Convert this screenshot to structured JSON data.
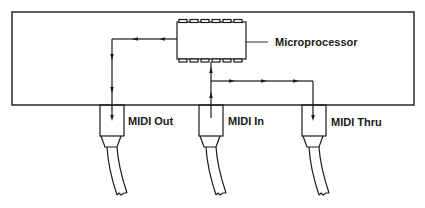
{
  "diagram": {
    "labels": {
      "microprocessor": "Microprocessor",
      "midi_out": "MIDI Out",
      "midi_in": "MIDI In",
      "midi_thru": "MIDI Thru"
    },
    "colors": {
      "stroke": "#1a1a1a",
      "background": "#ffffff"
    },
    "connections": [
      {
        "from": "Microprocessor",
        "to": "MIDI Out",
        "direction": "out"
      },
      {
        "from": "MIDI In",
        "to": "Microprocessor",
        "direction": "in"
      },
      {
        "from": "MIDI In",
        "to": "MIDI Thru",
        "direction": "thru"
      }
    ]
  }
}
